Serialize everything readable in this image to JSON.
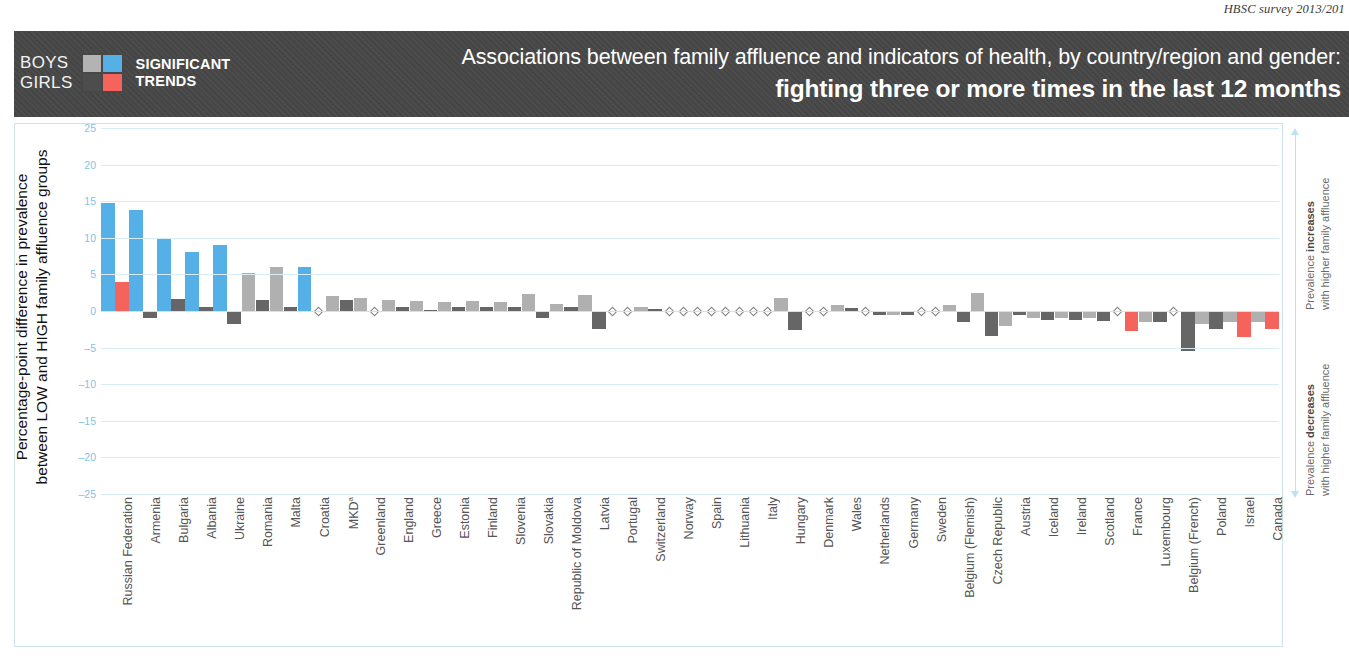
{
  "survey_credit": "HBSC survey 2013/201",
  "header": {
    "legend": {
      "row1_label": "BOYS",
      "row2_label": "GIRLS",
      "caption_line1": "SIGNIFICANT",
      "caption_line2": "TRENDS",
      "swatches": {
        "boys_nonsignificant": "#b3b3b3",
        "boys_significant": "#55b0e8",
        "girls_nonsignificant": "#4d4d4d",
        "girls_significant": "#f4645c"
      }
    },
    "title_line1": "Associations between family affluence and indicators of health, by country/region and gender:",
    "title_line2": "fighting three or more times in the last 12 months"
  },
  "y_axis_title_line1": "Percentage-point difference in prevalence",
  "y_axis_title_line2": "between LOW and HIGH family affluence groups",
  "right_annotation": {
    "top_line1_prefix": "Prevalence ",
    "top_line1_bold": "increases",
    "top_line2": "with higher family affluence",
    "bottom_line1_prefix": "Prevalence ",
    "bottom_line1_bold": "decreases",
    "bottom_line2": "with higher family affluence"
  },
  "chart_data": {
    "type": "bar",
    "title": "Associations between family affluence and indicators of health, by country/region and gender: fighting three or more times in the last 12 months",
    "xlabel": "",
    "ylabel": "Percentage-point difference in prevalence between LOW and HIGH family affluence groups",
    "ylim": [
      -25,
      25
    ],
    "yticks": [
      25,
      20,
      15,
      10,
      5,
      0,
      "–5",
      "–10",
      "–15",
      "–20",
      "–25"
    ],
    "grid": true,
    "legend_position": "header",
    "colors": {
      "boys_significant": "#55b0e8",
      "boys_nonsignificant": "#b0b0b0",
      "girls_significant": "#f4645c",
      "girls_nonsignificant": "#666666"
    },
    "note": "Diamond marker indicates a value of zero (no difference).",
    "categories": [
      "Russian Federation",
      "Armenia",
      "Bulgaria",
      "Albania",
      "Ukraine",
      "Romania",
      "Malta",
      "Croatia",
      "MKD",
      "Greenland",
      "England",
      "Greece",
      "Estonia",
      "Finland",
      "Slovenia",
      "Slovakia",
      "Republic of Moldova",
      "Latvia",
      "Portugal",
      "Switzerland",
      "Norway",
      "Spain",
      "Lithuania",
      "Italy",
      "Hungary",
      "Denmark",
      "Wales",
      "Netherlands",
      "Germany",
      "Sweden",
      "Belgium (Flemish)",
      "Czech Republic",
      "Austria",
      "Iceland",
      "Ireland",
      "Scotland",
      "France",
      "Luxembourg",
      "Belgium (French)",
      "Poland",
      "Israel",
      "Canada"
    ],
    "category_label_superscripts": {
      "MKD": "a"
    },
    "series": [
      {
        "name": "Boys",
        "values": [
          14.8,
          13.8,
          10.0,
          8.0,
          9.0,
          5.2,
          6.0,
          6.0,
          2.0,
          1.8,
          1.5,
          1.3,
          1.2,
          1.3,
          1.2,
          2.3,
          0.9,
          2.2,
          0.0,
          0.5,
          0.0,
          0.0,
          0.0,
          0.0,
          1.8,
          0.0,
          0.8,
          0.0,
          -0.6,
          0.0,
          0.8,
          2.5,
          -2.0,
          -0.9,
          -1.0,
          -1.0,
          0.0,
          -1.5,
          0.0,
          -1.8,
          -1.5,
          -1.5
        ],
        "significant": [
          true,
          true,
          true,
          true,
          true,
          false,
          false,
          true,
          false,
          false,
          false,
          false,
          false,
          false,
          false,
          false,
          false,
          false,
          false,
          false,
          false,
          false,
          false,
          false,
          false,
          false,
          false,
          false,
          false,
          false,
          false,
          false,
          false,
          false,
          false,
          false,
          false,
          false,
          false,
          false,
          false,
          false
        ]
      },
      {
        "name": "Girls",
        "values": [
          4.0,
          -1.0,
          1.7,
          0.5,
          -1.8,
          1.5,
          0.5,
          0.0,
          1.5,
          0.0,
          0.6,
          0.2,
          0.5,
          0.6,
          0.5,
          -0.9,
          0.6,
          -2.5,
          0.0,
          0.3,
          0.0,
          0.0,
          0.0,
          0.0,
          -2.6,
          0.0,
          0.4,
          -0.5,
          -0.5,
          0.0,
          -1.5,
          -3.4,
          -0.5,
          -1.2,
          -1.2,
          -1.4,
          -2.8,
          -1.5,
          -5.5,
          -2.5,
          -3.5,
          -2.5
        ],
        "significant": [
          true,
          false,
          false,
          false,
          false,
          false,
          false,
          false,
          false,
          false,
          false,
          false,
          false,
          false,
          false,
          false,
          false,
          false,
          false,
          false,
          false,
          false,
          false,
          false,
          false,
          false,
          false,
          false,
          false,
          false,
          false,
          false,
          false,
          false,
          false,
          false,
          true,
          false,
          false,
          false,
          true,
          true
        ]
      }
    ]
  }
}
